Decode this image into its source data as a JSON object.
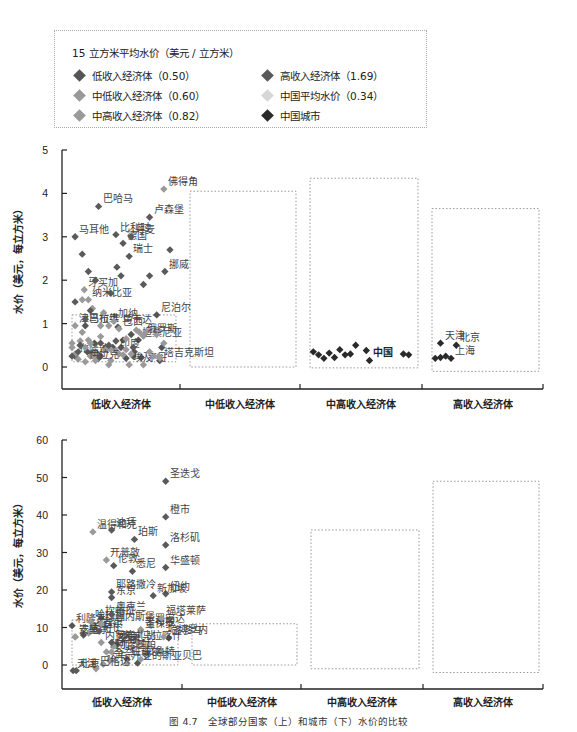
{
  "legend": {
    "title": "15 立方米平均水价（美元 / 立方米）",
    "items": [
      {
        "label": "低收入经济体（0.50）",
        "color": "#555555"
      },
      {
        "label": "高收入经济体（1.69）",
        "color": "#5a5a5a"
      },
      {
        "label": "中低收入经济体（0.60）",
        "color": "#999999"
      },
      {
        "label": "中国平均水价（0.34）",
        "color": "#d6d6d6"
      },
      {
        "label": "中高收入经济体（0.82）",
        "color": "#9a9a9a"
      },
      {
        "label": "中国城市",
        "color": "#2a2a2a"
      }
    ]
  },
  "caption": "图 4.7　全球部分国家（上）和城市（下）水价的比较",
  "chart_data": [
    {
      "type": "scatter",
      "title": "全球部分国家水价",
      "ylabel": "水价（美元，每立方米）",
      "xlabel": "",
      "ylim": [
        -0.5,
        5
      ],
      "yticks": [
        0,
        1,
        2,
        3,
        4,
        5
      ],
      "categories": [
        "低收入经济体",
        "中低收入经济体",
        "中高收入经济体",
        "高收入经济体"
      ],
      "boxes": [
        {
          "group": 0,
          "ymin": 0.12,
          "ymax": 1.2
        },
        {
          "group": 1,
          "ymin": 0.0,
          "ymax": 4.05
        },
        {
          "group": 2,
          "ymin": -0.02,
          "ymax": 4.35
        },
        {
          "group": 3,
          "ymin": -0.1,
          "ymax": 3.65
        }
      ],
      "series": [
        {
          "name": "低收入经济体",
          "color": "#555555",
          "points": [
            {
              "x": 0.05,
              "y": 0.25,
              "label": "布隆迪"
            },
            {
              "x": 0.15,
              "y": 0.95,
              "label": "马拉维"
            },
            {
              "x": 0.17,
              "y": 0.35
            },
            {
              "x": 0.22,
              "y": 0.3
            },
            {
              "x": 0.24,
              "y": 0.55
            },
            {
              "x": 0.27,
              "y": 0.3
            },
            {
              "x": 0.28,
              "y": 0.2
            },
            {
              "x": 0.3,
              "y": 0.25
            },
            {
              "x": 0.35,
              "y": 0.45
            },
            {
              "x": 0.42,
              "y": 0.45
            },
            {
              "x": 0.47,
              "y": 0.92,
              "label": "乌干达"
            },
            {
              "x": 0.5,
              "y": 0.45
            },
            {
              "x": 0.52,
              "y": 0.62
            },
            {
              "x": 0.55,
              "y": 0.2
            },
            {
              "x": 0.6,
              "y": 0.75
            },
            {
              "x": 0.62,
              "y": 0.25
            },
            {
              "x": 0.63,
              "y": 0.35
            },
            {
              "x": 0.67,
              "y": 0.62,
              "label": "坦桑尼亚"
            },
            {
              "x": 0.7,
              "y": 0.22
            },
            {
              "x": 0.72,
              "y": 0.72
            },
            {
              "x": 0.85,
              "y": 1.2,
              "label": "尼泊尔"
            },
            {
              "x": 0.88,
              "y": 0.15,
              "label": "塔吉克斯坦"
            },
            {
              "x": 0.9,
              "y": 0.45
            }
          ]
        },
        {
          "name": "中低收入经济体",
          "color": "#999999",
          "points": [
            {
              "x": 0.02,
              "y": 0.55
            },
            {
              "x": 0.05,
              "y": 0.95,
              "label": "津巴布韦"
            },
            {
              "x": 0.08,
              "y": 0.18
            },
            {
              "x": 0.1,
              "y": 0.5
            },
            {
              "x": 0.12,
              "y": 0.8
            },
            {
              "x": 0.15,
              "y": 0.45
            },
            {
              "x": 0.18,
              "y": 0.62
            },
            {
              "x": 0.2,
              "y": 0.25
            },
            {
              "x": 0.25,
              "y": 0.3
            },
            {
              "x": 0.3,
              "y": 0.95
            },
            {
              "x": 0.35,
              "y": 0.4
            },
            {
              "x": 0.38,
              "y": 0.05
            },
            {
              "x": 0.4,
              "y": 0.15
            },
            {
              "x": 0.43,
              "y": 1.05,
              "label": "加纳"
            },
            {
              "x": 0.45,
              "y": 0.38,
              "label": "印度"
            },
            {
              "x": 0.48,
              "y": 0.3
            },
            {
              "x": 0.52,
              "y": 0.28
            },
            {
              "x": 0.55,
              "y": 0.4
            },
            {
              "x": 0.58,
              "y": 0.05,
              "label": "埃及"
            },
            {
              "x": 0.65,
              "y": 0.85
            },
            {
              "x": 0.68,
              "y": 0.8
            },
            {
              "x": 0.72,
              "y": 0.05,
              "label": "不丹"
            },
            {
              "x": 0.75,
              "y": 0.82
            },
            {
              "x": 0.78,
              "y": 0.35
            },
            {
              "x": 0.82,
              "y": 0.25
            },
            {
              "x": 0.87,
              "y": 0.25
            },
            {
              "x": 0.92,
              "y": 0.55
            },
            {
              "x": 0.92,
              "y": 4.1,
              "label": "佛得角"
            }
          ]
        },
        {
          "name": "中高收入经济体",
          "color": "#9a9a9a",
          "points": [
            {
              "x": 0.02,
              "y": 0.45
            },
            {
              "x": 0.05,
              "y": 0.3
            },
            {
              "x": 0.12,
              "y": 1.55
            },
            {
              "x": 0.14,
              "y": 1.78,
              "label": "牙买加"
            },
            {
              "x": 0.18,
              "y": 1.55,
              "label": "纳米比亚"
            },
            {
              "x": 0.22,
              "y": 1.35
            },
            {
              "x": 0.33,
              "y": 1.25
            },
            {
              "x": 0.38,
              "y": 0.95
            },
            {
              "x": 0.48,
              "y": 0.88,
              "label": "巴西"
            },
            {
              "x": 0.55,
              "y": 0.65
            },
            {
              "x": 0.1,
              "y": 0.6
            },
            {
              "x": 0.2,
              "y": 0.55
            },
            {
              "x": 0.3,
              "y": 0.7
            },
            {
              "x": 0.15,
              "y": 0.12,
              "label": "伊拉克"
            },
            {
              "x": 0.25,
              "y": 0.15
            },
            {
              "x": 0.4,
              "y": 0.4
            },
            {
              "x": 0.6,
              "y": 0.3
            },
            {
              "x": 0.85,
              "y": 0.75
            },
            {
              "x": 0.88,
              "y": 0.2
            },
            {
              "x": 0.72,
              "y": 0.72,
              "label": "俄罗斯"
            }
          ]
        },
        {
          "name": "高收入经济体",
          "color": "#5a5a5a",
          "points": [
            {
              "x": 0.05,
              "y": 3.0,
              "label": "马耳他"
            },
            {
              "x": 0.28,
              "y": 3.7,
              "label": "巴哈马"
            },
            {
              "x": 0.45,
              "y": 3.05,
              "label": "比利时"
            },
            {
              "x": 0.52,
              "y": 2.85,
              "label": "德国"
            },
            {
              "x": 0.6,
              "y": 3.0,
              "label": "丹麦"
            },
            {
              "x": 0.58,
              "y": 2.55,
              "label": "瑞士"
            },
            {
              "x": 0.78,
              "y": 3.45,
              "label": "卢森堡"
            },
            {
              "x": 0.93,
              "y": 2.2,
              "label": "挪威"
            },
            {
              "x": 0.98,
              "y": 2.7
            },
            {
              "x": 0.12,
              "y": 2.6
            },
            {
              "x": 0.18,
              "y": 2.2
            },
            {
              "x": 0.25,
              "y": 2.0
            },
            {
              "x": 0.4,
              "y": 1.7
            },
            {
              "x": 0.46,
              "y": 2.3
            },
            {
              "x": 0.5,
              "y": 2.1
            },
            {
              "x": 0.72,
              "y": 1.9
            },
            {
              "x": 0.78,
              "y": 2.1
            },
            {
              "x": 0.05,
              "y": 1.5
            },
            {
              "x": 0.15,
              "y": 1.1
            },
            {
              "x": 0.2,
              "y": 1.3
            },
            {
              "x": 0.45,
              "y": 0.6
            },
            {
              "x": 0.38,
              "y": 0.5
            },
            {
              "x": 0.62,
              "y": 0.45
            },
            {
              "x": 0.1,
              "y": 0.5
            },
            {
              "x": 0.08,
              "y": 0.35
            },
            {
              "x": 0.02,
              "y": 0.25
            },
            {
              "x": 0.3,
              "y": 0.55
            }
          ]
        },
        {
          "name": "中国城市",
          "color": "#2a2a2a",
          "points": [
            {
              "x": 2.05,
              "y": 0.35
            },
            {
              "x": 2.1,
              "y": 0.28
            },
            {
              "x": 2.15,
              "y": 0.2
            },
            {
              "x": 2.2,
              "y": 0.32
            },
            {
              "x": 2.25,
              "y": 0.22
            },
            {
              "x": 2.3,
              "y": 0.4
            },
            {
              "x": 2.35,
              "y": 0.28
            },
            {
              "x": 2.4,
              "y": 0.3
            },
            {
              "x": 2.45,
              "y": 0.5
            },
            {
              "x": 2.55,
              "y": 0.38
            },
            {
              "x": 2.58,
              "y": 0.15,
              "label": "中国"
            },
            {
              "x": 2.9,
              "y": 0.3
            },
            {
              "x": 2.95,
              "y": 0.28
            },
            {
              "x": 3.1,
              "y": 0.55,
              "label": "天津"
            },
            {
              "x": 3.15,
              "y": 0.25
            },
            {
              "x": 3.25,
              "y": 0.5,
              "label": "北京"
            },
            {
              "x": 3.2,
              "y": 0.2,
              "label": "上海"
            },
            {
              "x": 3.05,
              "y": 0.2
            },
            {
              "x": 3.1,
              "y": 0.22
            }
          ]
        }
      ]
    },
    {
      "type": "scatter",
      "title": "全球部分城市水价",
      "ylabel": "水价（美元，每立方米）",
      "xlabel": "",
      "ylim": [
        -6,
        60
      ],
      "yticks": [
        0,
        10,
        20,
        30,
        40,
        50,
        60
      ],
      "categories": [
        "低收入经济体",
        "中低收入经济体",
        "中高收入经济体",
        "高收入经济体"
      ],
      "boxes": [
        {
          "group": 0,
          "ymin": 0,
          "ymax": 12
        },
        {
          "group": 1,
          "ymin": 0,
          "ymax": 11
        },
        {
          "group": 2,
          "ymin": -1,
          "ymax": 36
        },
        {
          "group": 3,
          "ymin": -2,
          "ymax": 49
        }
      ],
      "series": [
        {
          "name": "低收入经济体",
          "color": "#555555",
          "points": [
            {
              "x": 0.02,
              "y": 10.5,
              "label": "利隆圭"
            },
            {
              "x": 0.13,
              "y": 8,
              "label": "马普托"
            },
            {
              "x": 0.3,
              "y": 12.5,
              "label": "坎帕拉"
            },
            {
              "x": 0.45,
              "y": 5.5,
              "label": "洛美"
            },
            {
              "x": 0.55,
              "y": 1.5,
              "label": "班珠尔"
            },
            {
              "x": 0.65,
              "y": 0.5,
              "label": "亚的斯亚贝巴"
            },
            {
              "x": 0.95,
              "y": 7.2,
              "label": "多多马"
            }
          ]
        },
        {
          "name": "中低收入经济体",
          "color": "#999999",
          "points": [
            {
              "x": 0.05,
              "y": 7.5,
              "label": "达喀尔"
            },
            {
              "x": 0.2,
              "y": 11.5,
              "label": "哈拉雷"
            },
            {
              "x": 0.18,
              "y": 8.5,
              "label": "卢萨卡"
            },
            {
              "x": 0.3,
              "y": 6,
              "label": "内罗毕"
            },
            {
              "x": 0.35,
              "y": 3.5,
              "label": "班加罗尔"
            },
            {
              "x": 0.32,
              "y": 0.2,
              "label": "达卡"
            },
            {
              "x": 0.38,
              "y": 1.2,
              "label": "金奈"
            },
            {
              "x": 0.68,
              "y": 9.5,
              "label": "吉布提"
            },
            {
              "x": 0.78,
              "y": 10.5,
              "label": "罗安达"
            },
            {
              "x": 0.65,
              "y": 6,
              "label": "马拉喀什"
            },
            {
              "x": 0.55,
              "y": 0.5,
              "label": "开罗"
            }
          ]
        },
        {
          "name": "中高收入经济体",
          "color": "#9a9a9a",
          "points": [
            {
              "x": 0.22,
              "y": 35.5,
              "label": "温得和克"
            },
            {
              "x": 0.35,
              "y": 28,
              "label": "开普敦"
            },
            {
              "x": 0.3,
              "y": 11,
              "label": "约翰内斯堡"
            },
            {
              "x": 0.05,
              "y": 7.5,
              "label": "安曼"
            },
            {
              "x": 0.42,
              "y": 5,
              "label": "曼谷"
            },
            {
              "x": 0.4,
              "y": 3.5,
              "label": "阿雷基帕"
            },
            {
              "x": 0.25,
              "y": -1,
              "label": "巴格达"
            },
            {
              "x": 0.68,
              "y": 9,
              "label": "圣保罗"
            },
            {
              "x": 0.88,
              "y": 12.5,
              "label": "福塔莱萨"
            },
            {
              "x": 0.9,
              "y": 7.5,
              "label": "哈博罗内"
            },
            {
              "x": 0.68,
              "y": 1.5,
              "label": "贝鲁特"
            }
          ]
        },
        {
          "name": "高收入经济体",
          "color": "#5a5a5a",
          "points": [
            {
              "x": 0.92,
              "y": 49,
              "label": "圣迭戈"
            },
            {
              "x": 0.92,
              "y": 39.5,
              "label": "橙市"
            },
            {
              "x": 0.4,
              "y": 36,
              "label": "迪拜"
            },
            {
              "x": 0.62,
              "y": 33.5,
              "label": "珀斯"
            },
            {
              "x": 0.92,
              "y": 32,
              "label": "洛杉矶"
            },
            {
              "x": 0.92,
              "y": 26,
              "label": "华盛顿"
            },
            {
              "x": 0.6,
              "y": 25,
              "label": "悉尼"
            },
            {
              "x": 0.42,
              "y": 26.5,
              "label": "伦敦"
            },
            {
              "x": 0.4,
              "y": 19.5,
              "label": "耶路撒冷"
            },
            {
              "x": 0.4,
              "y": 18,
              "label": "东京"
            },
            {
              "x": 0.92,
              "y": 19,
              "label": "纽约"
            },
            {
              "x": 0.8,
              "y": 18.5,
              "label": "新加坡"
            },
            {
              "x": 0.4,
              "y": 13.5,
              "label": "奥克兰"
            },
            {
              "x": 0.28,
              "y": 9,
              "label": "首尔"
            },
            {
              "x": 0.4,
              "y": 6,
              "label": "阿布扎比"
            },
            {
              "x": 0.03,
              "y": -1.5,
              "label": "天津"
            },
            {
              "x": 0.06,
              "y": -1.5,
              "label": "北京"
            }
          ]
        }
      ]
    }
  ]
}
